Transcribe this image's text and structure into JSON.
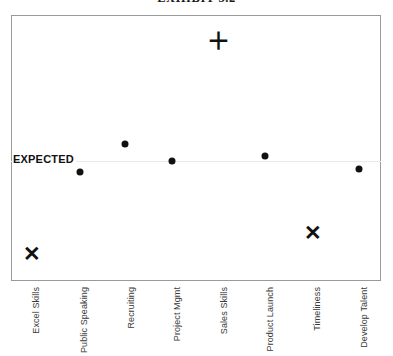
{
  "chart_data": {
    "type": "scatter",
    "title": "EXHIBIT 5.2",
    "xlabel": "",
    "ylabel": "",
    "categories": [
      "Excel Skills",
      "Public Speaking",
      "Recruiting",
      "Project Mgmt",
      "Sales Skills",
      "Product Launch",
      "Timeliness",
      "Develop Talent"
    ],
    "reference_line": {
      "label": "EXPECTED",
      "value": 0,
      "color": "#e9e9ec"
    },
    "series": [
      {
        "name": "Performance vs Expected",
        "markers": [
          "cross",
          "dot",
          "dot",
          "dot",
          "plus",
          "dot",
          "cross",
          "dot"
        ],
        "values": [
          -3.1,
          -0.35,
          0.55,
          0.0,
          4.0,
          0.2,
          -2.1,
          -0.3
        ]
      }
    ],
    "ylim": [
      -3.7,
      4.8
    ],
    "grid": false,
    "legend": "none",
    "marker_glyphs": {
      "dot": "●",
      "cross": "✕",
      "plus": "＋"
    },
    "marker_color": "#111111",
    "frame_color": "#9a9a9a"
  },
  "points": [
    {
      "label": "Excel Skills",
      "marker": "cross",
      "x_px": 32,
      "y_px": 253
    },
    {
      "label": "Public Speaking",
      "marker": "dot",
      "x_px": 80,
      "y_px": 172
    },
    {
      "label": "Recruiting",
      "marker": "dot",
      "x_px": 125,
      "y_px": 144
    },
    {
      "label": "Project Mgmt",
      "marker": "dot",
      "x_px": 172,
      "y_px": 161
    },
    {
      "label": "Sales Skills",
      "marker": "plus",
      "x_px": 218,
      "y_px": 41
    },
    {
      "label": "Product Launch",
      "marker": "dot",
      "x_px": 265,
      "y_px": 156
    },
    {
      "label": "Timeliness",
      "marker": "cross",
      "x_px": 313,
      "y_px": 232
    },
    {
      "label": "Develop Talent",
      "marker": "dot",
      "x_px": 359,
      "y_px": 169
    }
  ],
  "axis_labels": [
    {
      "text": "Excel Skills",
      "x_px": 31
    },
    {
      "text": "Public Speaking",
      "x_px": 79
    },
    {
      "text": "Recruiting",
      "x_px": 126
    },
    {
      "text": "Project Mgmt",
      "x_px": 172
    },
    {
      "text": "Sales Skills",
      "x_px": 219
    },
    {
      "text": "Product Launch",
      "x_px": 265
    },
    {
      "text": "Timeliness",
      "x_px": 312
    },
    {
      "text": "Develop Talent",
      "x_px": 359
    }
  ]
}
